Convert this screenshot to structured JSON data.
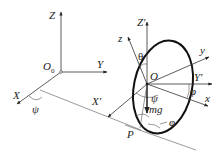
{
  "diagram": {
    "type": "rigid-body coordinate diagram (rolling disk / ellipse with Euler angles)",
    "fixed_frame": {
      "origin": "O",
      "origin_subscript": "0",
      "axes": {
        "z": "Z",
        "y": "Y",
        "x": "X"
      }
    },
    "moving_frame": {
      "origin": "O",
      "axes_primed": {
        "z": "Z'",
        "y": "Y'",
        "x": "X'"
      },
      "body_axes": {
        "z": "z",
        "y": "y",
        "x": "x"
      }
    },
    "angles": {
      "psi": "ψ",
      "theta": "θ",
      "phi": "φ"
    },
    "force_label": "mg",
    "contact_point": "P",
    "colors": {
      "stroke": "#333333",
      "disk": "#111111",
      "background": "#ffffff"
    }
  }
}
